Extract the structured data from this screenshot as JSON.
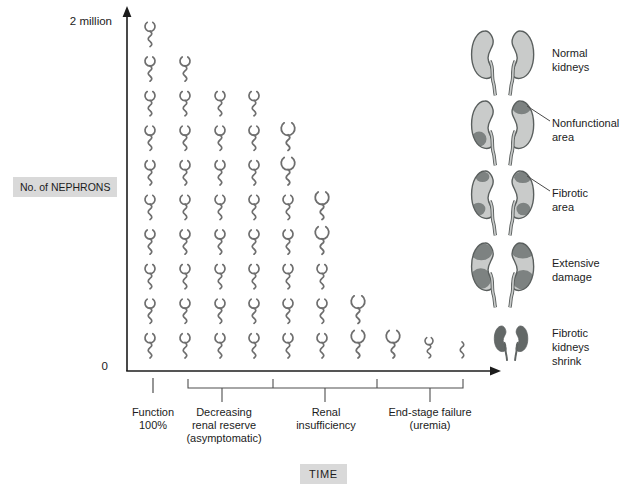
{
  "colors": {
    "background": "#ffffff",
    "axis": "#1c1c1c",
    "nephron_glyph": "#6e6e6e",
    "bracket": "#4f4f4f",
    "label_box_bg": "#d9d9d9",
    "text": "#1c1c1c",
    "kidney_fill": "#c9cbca",
    "kidney_patch": "#7d8281",
    "kidney_outline": "#5a5f5e",
    "kidney_shrunk_fill": "#636867"
  },
  "chart_data": {
    "type": "pictogram",
    "xlabel": "TIME",
    "ylabel": "No. of NEPHRONS",
    "y_top_label": "2 million",
    "y_bottom_label": "0",
    "y_axis_range": [
      0,
      2000000
    ],
    "symbol": "nephron-glyph (glomerular cup with wavy tubule tail)",
    "columns_symbol_counts": [
      10,
      9,
      8,
      8,
      7,
      5,
      2,
      1,
      1,
      1
    ],
    "columns": [
      {
        "count": 10,
        "glyphs": [
          "normal",
          "normal",
          "normal",
          "normal",
          "normal",
          "normal",
          "normal",
          "normal",
          "normal",
          "normal"
        ]
      },
      {
        "count": 9,
        "glyphs": [
          "normal",
          "normal",
          "normal",
          "normal",
          "normal",
          "normal",
          "normal",
          "normal",
          "normal"
        ]
      },
      {
        "count": 8,
        "glyphs": [
          "normal",
          "normal",
          "normal",
          "normal",
          "normal",
          "normal",
          "normal",
          "normal"
        ]
      },
      {
        "count": 8,
        "glyphs": [
          "normal",
          "normal",
          "normal",
          "normal",
          "normal",
          "normal",
          "normal",
          "normal"
        ]
      },
      {
        "count": 7,
        "glyphs": [
          "large",
          "large",
          "normal",
          "normal",
          "normal",
          "normal",
          "normal"
        ]
      },
      {
        "count": 5,
        "glyphs": [
          "large",
          "large",
          "normal",
          "normal",
          "normal"
        ]
      },
      {
        "count": 2,
        "glyphs": [
          "large",
          "large"
        ]
      },
      {
        "count": 1,
        "glyphs": [
          "large"
        ]
      },
      {
        "count": 1,
        "glyphs": [
          "small"
        ]
      },
      {
        "count": 1,
        "glyphs": [
          "tail"
        ]
      }
    ],
    "phases": [
      {
        "label": "Function\n100%"
      },
      {
        "label": "Decreasing\nrenal reserve\n(asymptomatic)"
      },
      {
        "label": "Renal\ninsufficiency"
      },
      {
        "label": "End-stage failure\n(uremia)"
      }
    ],
    "legend_position": "right"
  },
  "kidney_stages": [
    {
      "id": "normal-kidneys",
      "label": "Normal\nkidneys",
      "pointer": false
    },
    {
      "id": "nonfunctional-area",
      "label": "Nonfunctional\narea",
      "pointer": true
    },
    {
      "id": "fibrotic-area",
      "label": "Fibrotic\narea",
      "pointer": true
    },
    {
      "id": "extensive-damage",
      "label": "Extensive\ndamage",
      "pointer": false
    },
    {
      "id": "fibrotic-kidneys-shrink",
      "label": "Fibrotic\nkidneys\nshrink",
      "pointer": false
    }
  ]
}
